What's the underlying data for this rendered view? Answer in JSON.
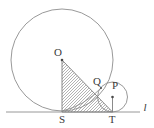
{
  "figure": {
    "background_color": "#ffffff",
    "stroke_color": "#8a8a8a",
    "label_color": "#3a3a3a",
    "hatch_color": "#9a9a9a",
    "labels": {
      "center_big": "O",
      "tangent_point_small_on_big": "Q",
      "center_small": "P",
      "foot_big": "S",
      "foot_small": "T",
      "line": "l"
    },
    "points": {
      "O": {
        "x": 62,
        "y": 60
      },
      "Q": {
        "x": 101,
        "y": 88
      },
      "P": {
        "x": 112.5,
        "y": 97
      },
      "S": {
        "x": 62,
        "y": 112
      },
      "T": {
        "x": 112.5,
        "y": 112
      }
    },
    "big_circle": {
      "cx": 62,
      "cy": 60,
      "r": 51
    },
    "small_circle": {
      "cx": 112.5,
      "cy": 97,
      "r": 15
    },
    "tangent_line": {
      "x1": 6,
      "y1": 112,
      "x2": 140,
      "y2": 112
    },
    "line_label_position": {
      "x": 145,
      "y": 111
    },
    "shaded_region": "triangle O-S-T",
    "arc_from_S_to_Q": "arc of small circle"
  }
}
